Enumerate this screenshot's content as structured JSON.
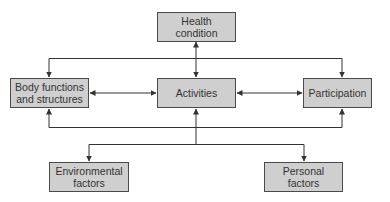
{
  "diagram": {
    "type": "flow-diagram",
    "nodes": {
      "health_condition": {
        "label": "Health\ncondition"
      },
      "body_functions": {
        "label": "Body functions\nand structures"
      },
      "activities": {
        "label": "Activities"
      },
      "participation": {
        "label": "Participation"
      },
      "environmental_factors": {
        "label": "Environmental\nfactors"
      },
      "personal_factors": {
        "label": "Personal\nfactors"
      }
    },
    "edges": [
      {
        "from": "health_condition",
        "to": "activities",
        "direction": "bidirectional"
      },
      {
        "from": "body_functions",
        "to": "activities",
        "direction": "bidirectional"
      },
      {
        "from": "activities",
        "to": "participation",
        "direction": "bidirectional"
      },
      {
        "from": "health_condition",
        "to": "body_functions",
        "direction": "to"
      },
      {
        "from": "health_condition",
        "to": "participation",
        "direction": "to"
      },
      {
        "from": "activities",
        "to": "body_functions",
        "direction": "to"
      },
      {
        "from": "activities",
        "to": "participation",
        "direction": "to"
      },
      {
        "from": "contextual_factors",
        "to": "activities",
        "direction": "to"
      },
      {
        "from": "activities",
        "to": "environmental_factors",
        "direction": "to"
      },
      {
        "from": "activities",
        "to": "personal_factors",
        "direction": "to"
      }
    ],
    "colors": {
      "box_fill": "#cfcfcf",
      "box_border": "#4a4a4a",
      "line": "#333333",
      "text": "#333333"
    }
  }
}
